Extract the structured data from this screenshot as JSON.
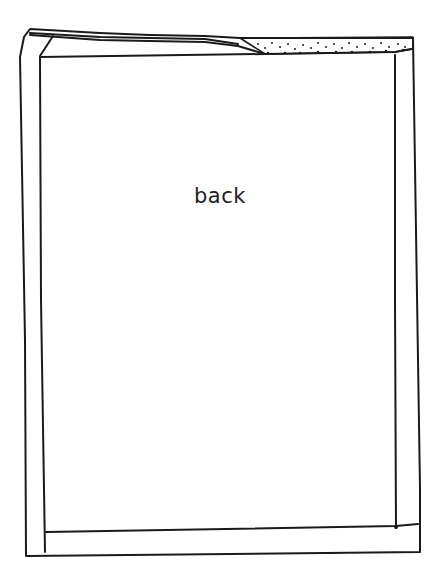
{
  "diagram": {
    "type": "sewing-pattern-sketch",
    "panel_label": "back",
    "stroke_color": "#1a1a1a",
    "shaded_region": "stippled top-right facing"
  }
}
